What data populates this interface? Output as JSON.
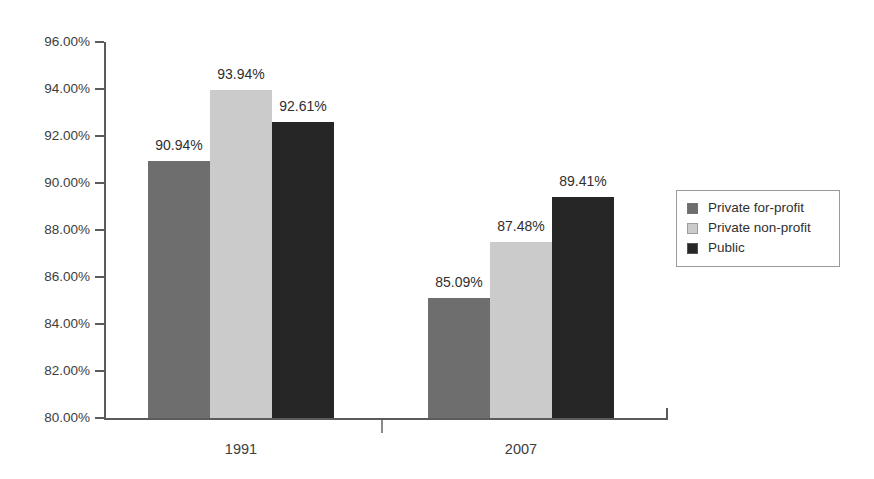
{
  "chart_data": {
    "type": "bar",
    "title": "",
    "subtitle": "",
    "xlabel": "",
    "ylabel": "",
    "categories": [
      "1991",
      "2007"
    ],
    "series": [
      {
        "name": "Private for-profit",
        "color": "#6e6e6e",
        "values": [
          90.94,
          87.48
        ],
        "value_labels": [
          "90.94%",
          "85.09%"
        ]
      },
      {
        "name": "Private non-profit",
        "color": "#cbcbcb",
        "values": [
          93.94,
          87.48
        ],
        "value_labels": [
          "93.94%",
          "87.48%"
        ]
      },
      {
        "name": "Public",
        "color": "#262626",
        "values": [
          92.61,
          89.41
        ],
        "value_labels": [
          "92.61%",
          "89.41%"
        ]
      }
    ],
    "points": [
      {
        "category": "1991",
        "series": "Private for-profit",
        "value": 90.94,
        "label": "90.94%"
      },
      {
        "category": "1991",
        "series": "Private non-profit",
        "value": 93.94,
        "label": "93.94%"
      },
      {
        "category": "1991",
        "series": "Public",
        "value": 92.61,
        "label": "92.61%"
      },
      {
        "category": "2007",
        "series": "Private for-profit",
        "value": 85.09,
        "label": "85.09%"
      },
      {
        "category": "2007",
        "series": "Private non-profit",
        "value": 87.48,
        "label": "87.48%"
      },
      {
        "category": "2007",
        "series": "Public",
        "value": 89.41,
        "label": "89.41%"
      }
    ],
    "ylim": [
      80,
      96
    ],
    "ytick_step": 2,
    "ytick_labels": [
      "96.00%",
      "94.00%",
      "92.00%",
      "90.00%",
      "88.00%",
      "86.00%",
      "84.00%",
      "82.00%",
      "80.00%"
    ],
    "ytick_values": [
      96,
      94,
      92,
      90,
      88,
      86,
      84,
      82,
      80
    ],
    "grid": false,
    "legend_position": "right"
  },
  "legend": {
    "items": [
      {
        "label": "Private for-profit",
        "color": "#6e6e6e"
      },
      {
        "label": "Private non-profit",
        "color": "#cbcbcb"
      },
      {
        "label": "Public",
        "color": "#262626"
      }
    ]
  }
}
